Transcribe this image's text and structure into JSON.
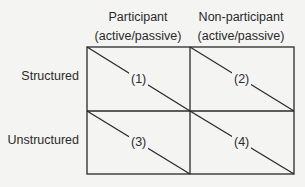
{
  "columns": [
    {
      "title": "Participant",
      "subtitle": "(active/passive)"
    },
    {
      "title": "Non-participant",
      "subtitle": "(active/passive)"
    }
  ],
  "rows": [
    {
      "label": "Structured"
    },
    {
      "label": "Unstructured"
    }
  ],
  "cells": [
    {
      "label": "(1)"
    },
    {
      "label": "(2)"
    },
    {
      "label": "(3)"
    },
    {
      "label": "(4)"
    }
  ],
  "colors": {
    "line": "#2a2a2a",
    "background": "#f4f4f2"
  }
}
